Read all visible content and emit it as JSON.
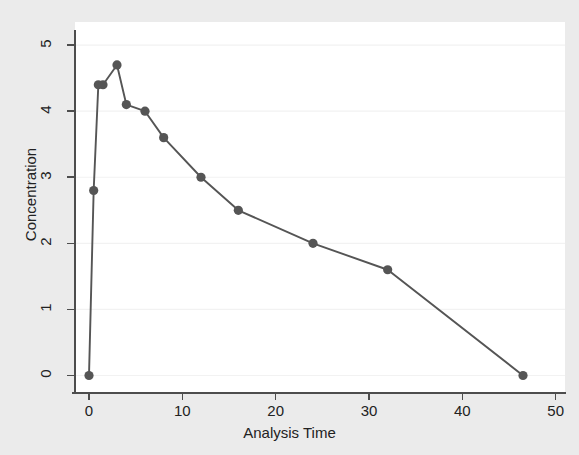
{
  "chart_data": {
    "type": "line",
    "title": "",
    "subtitle": "",
    "xlabel": "Analysis Time",
    "ylabel": "Concentration",
    "xlim": [
      -1.5,
      51
    ],
    "ylim": [
      -0.25,
      5.35
    ],
    "xticks": [
      0,
      10,
      20,
      30,
      40,
      50
    ],
    "xtick_labels": [
      "0",
      "10",
      "20",
      "30",
      "40",
      "50"
    ],
    "yticks": [
      0,
      1,
      2,
      3,
      4,
      5
    ],
    "ytick_labels": [
      "0",
      "1",
      "2",
      "3",
      "4",
      "5"
    ],
    "grid": "horizontal",
    "legend": null,
    "annotations": [],
    "marker": "circle",
    "line_color": "#555555",
    "marker_color": "#555555",
    "plot_bg": "#ffffff",
    "figure_bg": "#ebebeb",
    "grid_color": "#f2f2f2",
    "axis_color": "#4d4d4d",
    "series": [
      {
        "name": "Concentration",
        "x": [
          0,
          0.5,
          1,
          1.5,
          3,
          4,
          6,
          8,
          12,
          16,
          24,
          32,
          46.5
        ],
        "y": [
          0,
          2.8,
          4.4,
          4.4,
          4.7,
          4.1,
          4.0,
          3.6,
          3.0,
          2.5,
          2.0,
          1.6,
          0
        ]
      }
    ]
  }
}
